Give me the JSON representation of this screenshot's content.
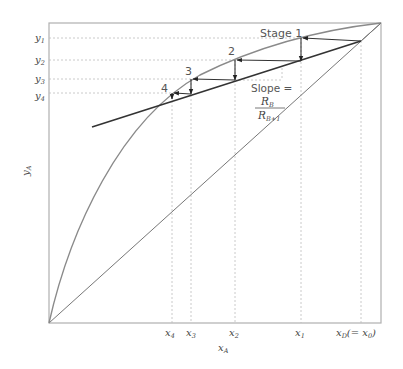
{
  "diagram": {
    "stage_labels": [
      "Stage 1",
      "2",
      "3",
      "4"
    ],
    "slope_label": "Slope =",
    "slope_numerator": "R",
    "slope_numerator_sub": "B",
    "slope_denominator": "R",
    "slope_denominator_sub": "B+1",
    "x_axis_label": "x",
    "x_axis_label_sub": "A",
    "y_axis_label": "y",
    "y_axis_label_sub": "A",
    "y_ticks": [
      {
        "main": "y",
        "sub": "1"
      },
      {
        "main": "y",
        "sub": "2"
      },
      {
        "main": "y",
        "sub": "3"
      },
      {
        "main": "y",
        "sub": "4"
      }
    ],
    "x_ticks": [
      {
        "main": "x",
        "sub": "4"
      },
      {
        "main": "x",
        "sub": "3"
      },
      {
        "main": "x",
        "sub": "2"
      },
      {
        "main": "x",
        "sub": "1"
      },
      {
        "main": "x",
        "sub": "D",
        "suffix": "(= x",
        "suffix_sub": "0",
        "suffix_end": ")"
      }
    ],
    "colors": {
      "frame": "#aaaaaa",
      "curve": "#8a8a8a",
      "operating_line": "#333333",
      "steps": "#333333",
      "guides": "#bbbbbb"
    }
  }
}
